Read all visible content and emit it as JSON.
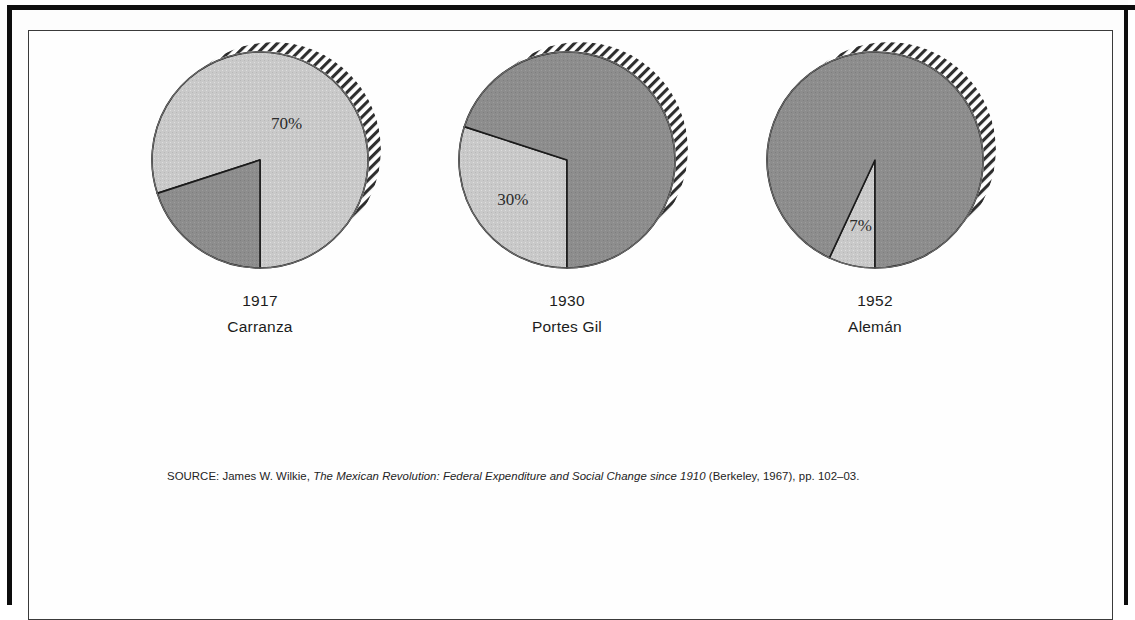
{
  "figure": {
    "border_color": "#0d0d0d",
    "inner_border_color": "#3a3a3a",
    "background": "#fdfdfd"
  },
  "colors": {
    "light_slice": "#c9c9c9",
    "dark_slice": "#8d8d8d",
    "outline": "#1a1a1a",
    "shadow_hatch": "#2e2e2e",
    "text": "#1c1c1c"
  },
  "chart_data": {
    "type": "pie",
    "title": "",
    "subtitle": "",
    "xlabel": "",
    "ylabel": "",
    "legend_position": "none",
    "grid": false,
    "charts": [
      {
        "year": "1917",
        "president": "Carranza",
        "label": "70%",
        "label_value": 70,
        "slices": [
          {
            "name": "highlighted",
            "value": 70,
            "shade": "light",
            "start_deg": 252,
            "end_deg": 180
          },
          {
            "name": "remainder",
            "value": 30,
            "shade": "dark",
            "start_deg": 180,
            "end_deg": 252
          }
        ]
      },
      {
        "year": "1930",
        "president": "Portes Gil",
        "label": "30%",
        "label_value": 30,
        "slices": [
          {
            "name": "highlighted",
            "value": 30,
            "shade": "light",
            "start_deg": 180,
            "end_deg": 288
          },
          {
            "name": "remainder",
            "value": 70,
            "shade": "dark",
            "start_deg": 288,
            "end_deg": 180
          }
        ]
      },
      {
        "year": "1952",
        "president": "Alemán",
        "label": "7%",
        "label_value": 7,
        "slices": [
          {
            "name": "highlighted",
            "value": 7,
            "shade": "light",
            "start_deg": 180,
            "end_deg": 205
          },
          {
            "name": "remainder",
            "value": 93,
            "shade": "dark",
            "start_deg": 205,
            "end_deg": 180
          }
        ]
      }
    ]
  },
  "source": {
    "label": "SOURCE: James W. Wilkie, ",
    "title": "The Mexican Revolution: Federal Expenditure and Social Change since 1910",
    "tail": " (Berkeley, 1967), pp. 102–03."
  }
}
